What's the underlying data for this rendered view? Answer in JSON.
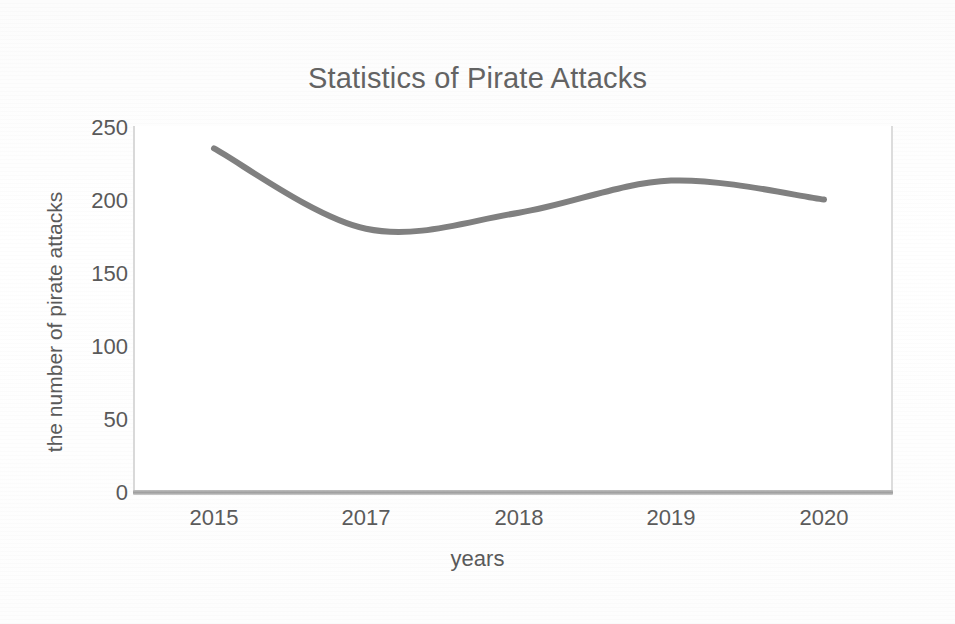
{
  "chart_data": {
    "type": "line",
    "title": "Statistics of Pirate Attacks",
    "xlabel": "years",
    "ylabel": "the number of pirate attacks",
    "categories": [
      "2015",
      "2017",
      "2018",
      "2019",
      "2020"
    ],
    "x_tick_labels": [
      "2015",
      "2017",
      "2018",
      "2019",
      "2020"
    ],
    "y_tick_labels": [
      "0",
      "50",
      "100",
      "150",
      "200",
      "250"
    ],
    "y_ticks": [
      0,
      50,
      100,
      150,
      200,
      250
    ],
    "ylim": [
      0,
      250
    ],
    "grid": false,
    "legend": false,
    "smoothed": true,
    "series": [
      {
        "name": "the number of pirate attacks",
        "values": [
          236,
          181,
          192,
          214,
          201
        ]
      }
    ],
    "line_color": "#808080"
  }
}
